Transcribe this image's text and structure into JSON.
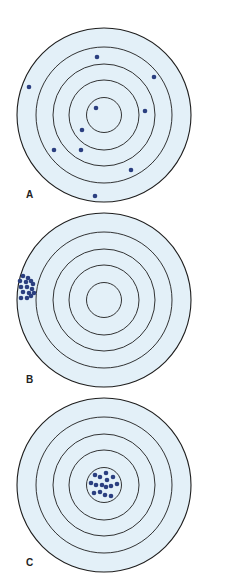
{
  "colors": {
    "target_fill": "#e3f0f8",
    "ring_stroke": "#1e1e1e",
    "dot": "#2b3f80",
    "label": "#222222"
  },
  "ring_radii": [
    87,
    68,
    51,
    35,
    17.5
  ],
  "targets": [
    {
      "id": "A",
      "label": "A",
      "center": [
        104,
        115
      ],
      "label_pos": [
        26,
        198
      ],
      "shots": [
        [
          97,
          57
        ],
        [
          154,
          77
        ],
        [
          29,
          87
        ],
        [
          96,
          108
        ],
        [
          145,
          111
        ],
        [
          82,
          130
        ],
        [
          54,
          150
        ],
        [
          81,
          150
        ],
        [
          131,
          170
        ],
        [
          95,
          196
        ]
      ]
    },
    {
      "id": "B",
      "label": "B",
      "center": [
        104,
        300
      ],
      "label_pos": [
        26,
        383
      ],
      "shots": [
        [
          23,
          276
        ],
        [
          28,
          278
        ],
        [
          20,
          281
        ],
        [
          26,
          282
        ],
        [
          31,
          281
        ],
        [
          33,
          284
        ],
        [
          21,
          287
        ],
        [
          27,
          287
        ],
        [
          32,
          289
        ],
        [
          23,
          292
        ],
        [
          29,
          293
        ],
        [
          34,
          293
        ],
        [
          21,
          298
        ],
        [
          27,
          298
        ],
        [
          31,
          296
        ]
      ]
    },
    {
      "id": "C",
      "label": "C",
      "center": [
        104,
        485
      ],
      "label_pos": [
        26,
        566
      ],
      "shots": [
        [
          95,
          475
        ],
        [
          100,
          477
        ],
        [
          106,
          473
        ],
        [
          113,
          477
        ],
        [
          107,
          480
        ],
        [
          91,
          483
        ],
        [
          96,
          485
        ],
        [
          102,
          485
        ],
        [
          106,
          487
        ],
        [
          111,
          486
        ],
        [
          117,
          484
        ],
        [
          94,
          493
        ],
        [
          100,
          492
        ],
        [
          105,
          495
        ],
        [
          111,
          496
        ]
      ]
    }
  ]
}
